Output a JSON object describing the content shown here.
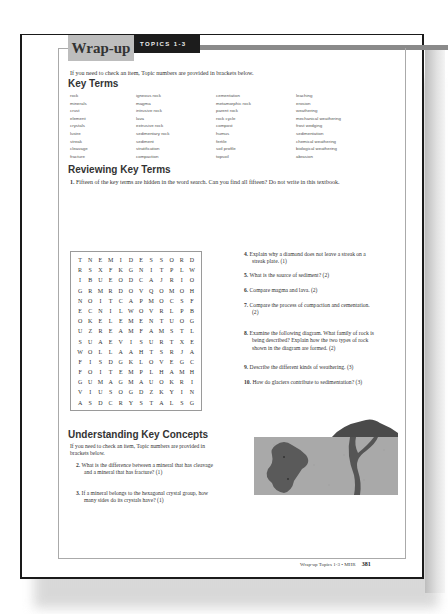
{
  "header": {
    "title": "Wrap-up",
    "topics_label": "TOPICS 1-3"
  },
  "intro": "If you need to check an item, Topic numbers are provided in brackets below.",
  "key_terms": {
    "heading": "Key Terms",
    "columns": [
      [
        "rock",
        "minerals",
        "crust",
        "element",
        "crystals",
        "lustre",
        "streak",
        "cleavage",
        "fracture"
      ],
      [
        "igneous rock",
        "magma",
        "intrusive rock",
        "lava",
        "extrusive rock",
        "sedimentary rock",
        "sediment",
        "stratification",
        "compaction"
      ],
      [
        "cementation",
        "metamorphic rock",
        "parent rock",
        "rock cycle",
        "compost",
        "humus",
        "fertile",
        "soil profile",
        "topsoil"
      ],
      [
        "leaching",
        "erosion",
        "weathering",
        "mechanical weathering",
        "frost wedging",
        "sedimentation",
        "chemical weathering",
        "biological weathering",
        "abrasion"
      ]
    ]
  },
  "reviewing": {
    "heading": "Reviewing Key Terms",
    "q1_num": "1.",
    "q1_text": "Fifteen of the key terms are hidden in the word search. Can you find all fifteen? Do not write in this textbook."
  },
  "word_search": [
    [
      "T",
      "N",
      "E",
      "M",
      "I",
      "D",
      "E",
      "S",
      "S",
      "O",
      "R",
      "D"
    ],
    [
      "R",
      "S",
      "X",
      "F",
      "K",
      "G",
      "N",
      "I",
      "T",
      "P",
      "L",
      "W"
    ],
    [
      "I",
      "B",
      "U",
      "E",
      "O",
      "D",
      "C",
      "A",
      "J",
      "R",
      "I",
      "O"
    ],
    [
      "G",
      "R",
      "M",
      "R",
      "D",
      "O",
      "V",
      "Q",
      "O",
      "M",
      "O",
      "H"
    ],
    [
      "N",
      "O",
      "I",
      "T",
      "C",
      "A",
      "P",
      "M",
      "O",
      "C",
      "S",
      "F"
    ],
    [
      "E",
      "C",
      "N",
      "I",
      "L",
      "W",
      "O",
      "V",
      "R",
      "L",
      "P",
      "B"
    ],
    [
      "O",
      "K",
      "E",
      "L",
      "E",
      "M",
      "E",
      "N",
      "T",
      "U",
      "O",
      "G"
    ],
    [
      "U",
      "Z",
      "R",
      "E",
      "A",
      "M",
      "F",
      "A",
      "M",
      "S",
      "T",
      "L"
    ],
    [
      "S",
      "U",
      "A",
      "E",
      "V",
      "I",
      "S",
      "U",
      "R",
      "T",
      "X",
      "E"
    ],
    [
      "W",
      "O",
      "L",
      "L",
      "A",
      "A",
      "H",
      "T",
      "S",
      "R",
      "J",
      "A"
    ],
    [
      "F",
      "I",
      "S",
      "D",
      "G",
      "K",
      "L",
      "O",
      "V",
      "E",
      "G",
      "C"
    ],
    [
      "F",
      "O",
      "I",
      "T",
      "E",
      "M",
      "P",
      "L",
      "H",
      "A",
      "M",
      "H"
    ],
    [
      "G",
      "U",
      "M",
      "A",
      "G",
      "M",
      "A",
      "U",
      "O",
      "K",
      "R",
      "I"
    ],
    [
      "V",
      "I",
      "U",
      "S",
      "O",
      "G",
      "D",
      "Z",
      "K",
      "Y",
      "I",
      "N"
    ],
    [
      "A",
      "S",
      "D",
      "C",
      "R",
      "Y",
      "S",
      "T",
      "A",
      "L",
      "S",
      "G"
    ]
  ],
  "understanding": {
    "heading": "Understanding Key Concepts",
    "intro": "If you need to check an item, Topic numbers are provided in brackets below.",
    "questions": [
      {
        "num": "2.",
        "text": "What is the difference between a mineral that has cleavage and a mineral that has fracture? (1)"
      },
      {
        "num": "3.",
        "text": "If a mineral belongs to the hexagonal crystal group, how many sides do its crystals have? (1)"
      }
    ]
  },
  "right_questions": [
    {
      "num": "4.",
      "text": "Explain why a diamond does not leave a streak on a streak plate. (1)"
    },
    {
      "num": "5.",
      "text": "What is the source of sediment? (2)"
    },
    {
      "num": "6.",
      "text": "Compare magma and lava. (2)"
    },
    {
      "num": "7.",
      "text": "Compare the process of compaction and cementation. (2)"
    },
    {
      "num": "8.",
      "text": "Examine the following diagram. What family of rock is being described? Explain how the two types of rock shown in the diagram are formed. (2)"
    },
    {
      "num": "9.",
      "text": "Describe the different kinds of weathering. (3)"
    },
    {
      "num": "10.",
      "text": "How do glaciers contribute to sedimentation? (3)"
    }
  ],
  "diagram": {
    "icon": "igneous-rock-diagram",
    "colors": {
      "ground": "#a8a8a8",
      "intrusion": "#5a5a5a",
      "volcano": "#4a4a4a"
    }
  },
  "footer": {
    "text": "Wrap-up Topics 1-3 • MHR",
    "page": "381"
  }
}
